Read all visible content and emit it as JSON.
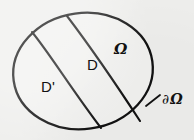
{
  "figure": {
    "kind": "math-set-diagram",
    "background_color": "#efefed",
    "ink_color": "#111111",
    "labels": {
      "omega": "Ω",
      "subdomain_d": "D",
      "subdomain_d_prime": "D'",
      "boundary_partial": "∂",
      "boundary_omega": "Ω",
      "boundary_full": "∂Ω"
    },
    "regions": [
      {
        "name": "outer-region",
        "label": "Ω"
      },
      {
        "name": "middle-region",
        "label": "D"
      },
      {
        "name": "inner-region",
        "label": "D'"
      }
    ],
    "annotations": [
      {
        "name": "boundary-callout",
        "label": "∂Ω"
      }
    ],
    "geometry": {
      "ellipse_cx": 83,
      "ellipse_cy": 71,
      "ellipse_rx": 70,
      "ellipse_ry": 58,
      "ellipse_rotation_deg": -8,
      "divider_left": "M 32 32 C 52 55, 74 92, 101 128",
      "divider_right": "M 67 16 C 88 42, 114 80, 140 121",
      "leader_line": "M 146 106 L 160 95"
    }
  }
}
